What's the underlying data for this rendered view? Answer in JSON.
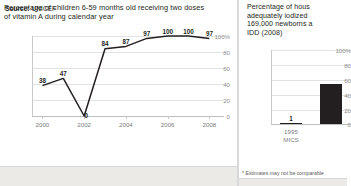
{
  "left_panel": {
    "title": "Percentage of children 6-59 months old receiving two doses\nof vitamin A during calendar year",
    "source_label": "Source:",
    "source_value": "UNICEF"
  },
  "right_panel": {
    "title": "Percentage of hous\nadequately iodized\n169,000 newborns a\nIDD (2008)",
    "footnote": "* Estimates may not be comparable"
  },
  "chart_data": [
    {
      "id": "vitamin-a-line",
      "type": "line",
      "title": "Percentage of children 6-59 months old receiving two doses of vitamin A during calendar year",
      "xlabel": "",
      "ylabel": "",
      "x": [
        2000,
        2001,
        2002,
        2003,
        2004,
        2005,
        2006,
        2007,
        2008
      ],
      "values": [
        38,
        47,
        0,
        84,
        87,
        97,
        100,
        100,
        97
      ],
      "point_labels": [
        "38",
        "47",
        "0",
        "84",
        "87",
        "97",
        "100",
        "100",
        "97"
      ],
      "xlim": [
        1999.5,
        2008.7
      ],
      "ylim": [
        0,
        100
      ],
      "xticks": [
        2000,
        2002,
        2004,
        2006,
        2008
      ],
      "xticklabels": [
        "2000",
        "2002",
        "2004",
        "2006",
        "2008"
      ],
      "yticks": [
        0,
        20,
        40,
        60,
        80,
        100
      ],
      "yticklabels": [
        "0",
        "20",
        "40",
        "60",
        "80",
        "100%"
      ],
      "grid": true,
      "legend": "none",
      "line_color": "#231f20"
    },
    {
      "id": "iodized-salt-bar",
      "type": "bar",
      "title": "Percentage of households consuming adequately iodized salt",
      "xlabel": "",
      "ylabel": "",
      "categories": [
        "1995\nMICS",
        ""
      ],
      "category_lines": [
        [
          "1995",
          "MICS"
        ],
        [
          "",
          ""
        ]
      ],
      "values": [
        1,
        54
      ],
      "bar_labels": [
        "1",
        ""
      ],
      "ylim": [
        0,
        100
      ],
      "yticks": [
        0,
        20,
        40,
        60,
        80,
        100
      ],
      "yticklabels": [
        "0",
        "20",
        "40",
        "60",
        "80",
        "100%"
      ],
      "grid": true,
      "legend": "none",
      "bar_color": "#231f20"
    }
  ]
}
